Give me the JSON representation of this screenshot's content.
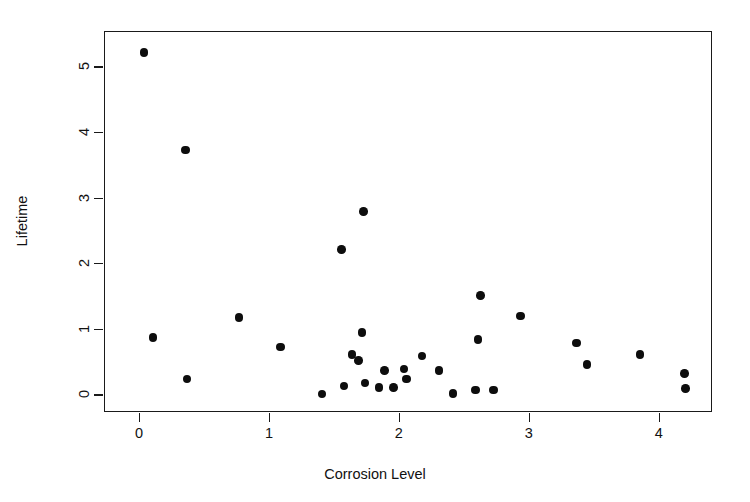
{
  "chart_data": {
    "type": "scatter",
    "title": "",
    "xlabel": "Corrosion Level",
    "ylabel": "Lifetime",
    "xlim": [
      -0.27,
      4.41
    ],
    "ylim": [
      -0.27,
      5.54
    ],
    "xticks": [
      0,
      1,
      2,
      3,
      4
    ],
    "xtick_labels": [
      "0",
      "1",
      "2",
      "3",
      "4"
    ],
    "yticks": [
      0,
      1,
      2,
      3,
      4,
      5
    ],
    "ytick_labels": [
      "0",
      "1",
      "2",
      "3",
      "4",
      "5"
    ],
    "grid": false,
    "legend": null,
    "marker": "filled-circle",
    "marker_color": "#0d0d0d",
    "points": [
      {
        "x": 0.03,
        "y": 5.23
      },
      {
        "x": 0.1,
        "y": 0.88
      },
      {
        "x": 0.35,
        "y": 3.74
      },
      {
        "x": 0.36,
        "y": 0.25
      },
      {
        "x": 0.76,
        "y": 1.19
      },
      {
        "x": 1.08,
        "y": 0.74
      },
      {
        "x": 1.4,
        "y": 0.02
      },
      {
        "x": 1.55,
        "y": 2.22
      },
      {
        "x": 1.57,
        "y": 0.14
      },
      {
        "x": 1.63,
        "y": 0.62
      },
      {
        "x": 1.68,
        "y": 0.53
      },
      {
        "x": 1.71,
        "y": 0.96
      },
      {
        "x": 1.72,
        "y": 2.8
      },
      {
        "x": 1.73,
        "y": 0.19
      },
      {
        "x": 1.84,
        "y": 0.12
      },
      {
        "x": 1.88,
        "y": 0.38
      },
      {
        "x": 1.95,
        "y": 0.12
      },
      {
        "x": 2.03,
        "y": 0.4
      },
      {
        "x": 2.05,
        "y": 0.25
      },
      {
        "x": 2.17,
        "y": 0.6
      },
      {
        "x": 2.3,
        "y": 0.38
      },
      {
        "x": 2.41,
        "y": 0.03
      },
      {
        "x": 2.58,
        "y": 0.08
      },
      {
        "x": 2.6,
        "y": 0.85
      },
      {
        "x": 2.62,
        "y": 1.52
      },
      {
        "x": 2.72,
        "y": 0.08
      },
      {
        "x": 2.93,
        "y": 1.21
      },
      {
        "x": 3.36,
        "y": 0.8
      },
      {
        "x": 3.44,
        "y": 0.47
      },
      {
        "x": 3.85,
        "y": 0.62
      },
      {
        "x": 4.19,
        "y": 0.33
      },
      {
        "x": 4.2,
        "y": 0.1
      }
    ]
  }
}
